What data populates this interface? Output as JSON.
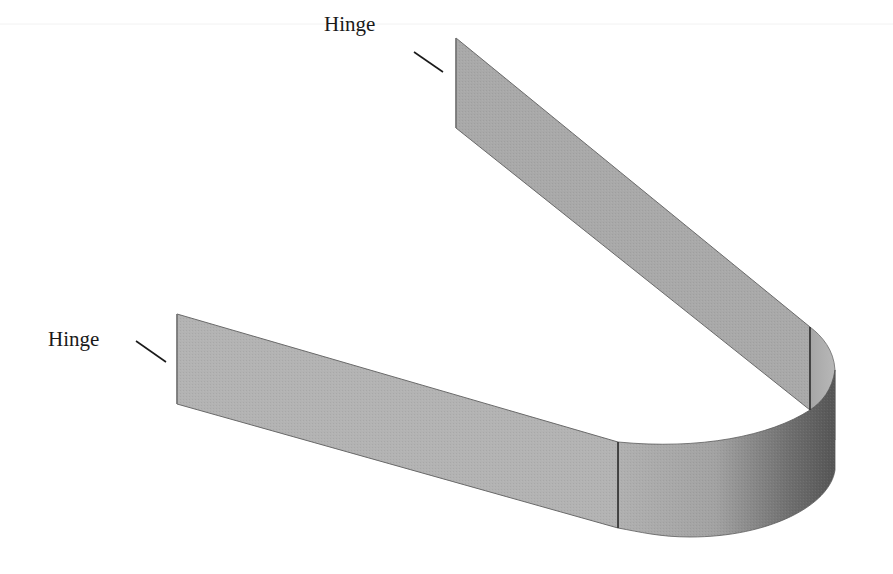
{
  "figure": {
    "labels": [
      {
        "id": "hinge-top",
        "text": "Hinge"
      },
      {
        "id": "hinge-left",
        "text": "Hinge"
      }
    ],
    "parts": [
      {
        "id": "upper-flat-strip",
        "shade": "#a9a9a9"
      },
      {
        "id": "lower-flat-strip",
        "shade": "#b3b3b3"
      },
      {
        "id": "curved-bend",
        "shade_light": "#adadad",
        "shade_dark": "#5e5e5e"
      }
    ],
    "colors": {
      "background": "#ffffff",
      "edge": "#4a4a4a",
      "leader_line": "#1a1a1a"
    }
  }
}
